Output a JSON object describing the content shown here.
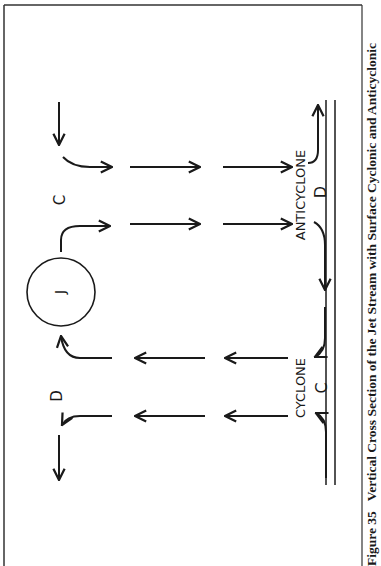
{
  "figure": {
    "caption": "Figure 35   Vertical Cross Section of the Jet Stream with Surface Cyclonic and Anticyclonic",
    "jet_label": "J",
    "upper_labels": {
      "divergence": "D",
      "convergence": "C"
    },
    "surface_labels": {
      "cyclone": "CYCLONE",
      "cyclone_symbol": "C",
      "anticyclone": "ANTICYCLONE",
      "anticyclone_symbol": "D"
    },
    "colors": {
      "ink": "#1a1a1a",
      "frame": "#333333",
      "background": "#ffffff"
    }
  }
}
